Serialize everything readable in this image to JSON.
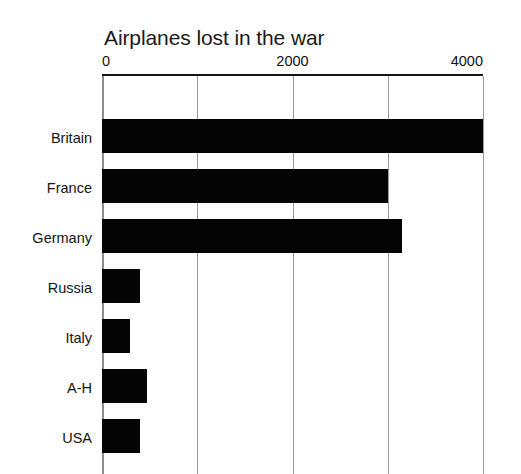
{
  "chart_data": {
    "type": "bar",
    "orientation": "horizontal",
    "title": "Airplanes lost in the war",
    "xlabel": "",
    "ylabel": "",
    "categories": [
      "Britain",
      "France",
      "Germany",
      "Russia",
      "Italy",
      "A-H",
      "USA"
    ],
    "values": [
      4000,
      3000,
      3150,
      400,
      290,
      470,
      400
    ],
    "xlim": [
      0,
      4000
    ],
    "xticks": [
      0,
      2000,
      4000
    ],
    "xticklabels": [
      "0",
      "2000",
      "4000"
    ],
    "gridlines": [
      0,
      1000,
      2000,
      3000,
      4000
    ],
    "grid": true,
    "axis_position": "top",
    "legend": null,
    "series": [
      {
        "name": "Airplanes lost",
        "values": [
          4000,
          3000,
          3150,
          400,
          290,
          470,
          400
        ]
      }
    ],
    "colors": {
      "bar": "#050505",
      "gridline": "#9a9a9a",
      "axis_line": "#141414",
      "background": "#ffffff",
      "text": "#141414"
    }
  },
  "title": "Airplanes lost in the war",
  "axis": {
    "ticks": [
      {
        "label": "0",
        "value": 0
      },
      {
        "label": "2000",
        "value": 2000
      },
      {
        "label": "4000",
        "value": 4000
      }
    ]
  },
  "bars": [
    {
      "category": "Britain",
      "value": 4000
    },
    {
      "category": "France",
      "value": 3000
    },
    {
      "category": "Germany",
      "value": 3150
    },
    {
      "category": "Russia",
      "value": 400
    },
    {
      "category": "Italy",
      "value": 290
    },
    {
      "category": "A-H",
      "value": 470
    },
    {
      "category": "USA",
      "value": 400
    }
  ]
}
